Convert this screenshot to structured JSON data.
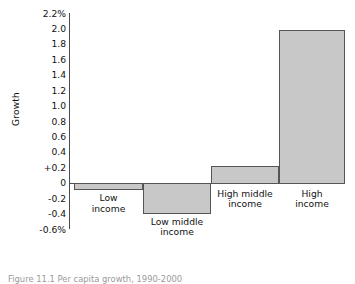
{
  "chart_data": {
    "type": "bar",
    "title": "",
    "xlabel": "",
    "ylabel": "Growth",
    "categories": [
      "Low income",
      "Low middle income",
      "High middle income",
      "High income"
    ],
    "values": [
      -0.1,
      -0.4,
      0.22,
      1.98
    ],
    "ylim": [
      -0.6,
      2.2
    ],
    "grid": false,
    "legend": null,
    "ytick_labels": [
      "2.2%",
      "2.0",
      "1.8",
      "1.6",
      "1.4",
      "1.2",
      "1.0",
      "0.8",
      "0.6",
      "0.4",
      "+0.2",
      "0",
      "-0.2",
      "-0.4",
      "-0.6%"
    ],
    "ytick_values": [
      2.2,
      2.0,
      1.8,
      1.6,
      1.4,
      1.2,
      1.0,
      0.8,
      0.6,
      0.4,
      0.2,
      0,
      -0.2,
      -0.4,
      -0.6
    ],
    "series": [
      {
        "name": "Growth",
        "values": [
          -0.1,
          -0.4,
          0.22,
          1.98
        ]
      }
    ],
    "bar_color": "#c8c8c8",
    "bar_border_color": "#555555",
    "axis_color": "#4c4c4c"
  },
  "axis": {
    "ylabel": "Growth",
    "ticks": [
      {
        "label": "2.2%",
        "value": 2.2
      },
      {
        "label": "2.0",
        "value": 2.0
      },
      {
        "label": "1.8",
        "value": 1.8
      },
      {
        "label": "1.6",
        "value": 1.6
      },
      {
        "label": "1.4",
        "value": 1.4
      },
      {
        "label": "1.2",
        "value": 1.2
      },
      {
        "label": "1.0",
        "value": 1.0
      },
      {
        "label": "0.8",
        "value": 0.8
      },
      {
        "label": "0.6",
        "value": 0.6
      },
      {
        "label": "0.4",
        "value": 0.4
      },
      {
        "label": "+0.2",
        "value": 0.2
      },
      {
        "label": "0",
        "value": 0
      },
      {
        "label": "-0.2",
        "value": -0.2
      },
      {
        "label": "-0.4",
        "value": -0.4
      },
      {
        "label": "-0.6%",
        "value": -0.6
      }
    ]
  },
  "bars": [
    {
      "label_line1": "Low",
      "label_line2": "income",
      "value": -0.1
    },
    {
      "label_line1": "Low middle",
      "label_line2": "income",
      "value": -0.4
    },
    {
      "label_line1": "High middle",
      "label_line2": "income",
      "value": 0.22
    },
    {
      "label_line1": "High",
      "label_line2": "income",
      "value": 1.98
    }
  ],
  "caption": {
    "text": "Figure 11.1  Per capita growth, 1990-2000"
  }
}
